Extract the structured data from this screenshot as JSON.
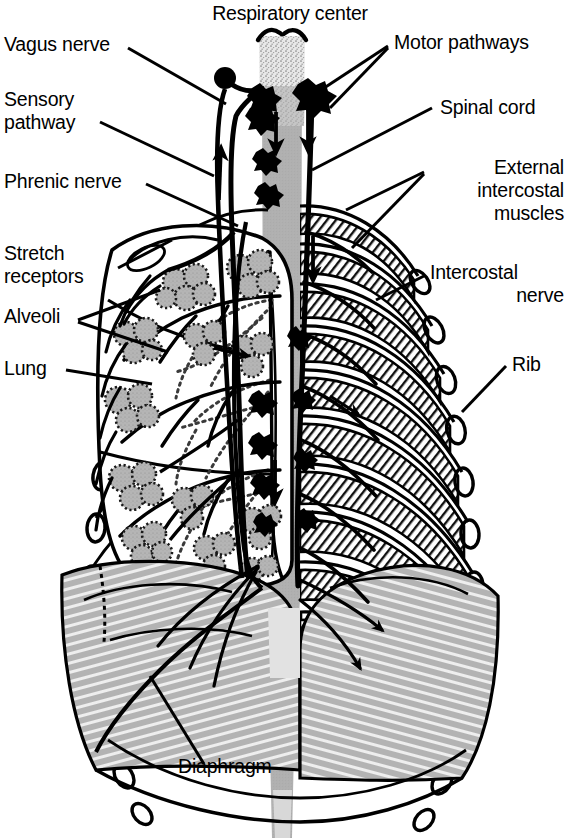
{
  "figure": {
    "title": "Respiratory center",
    "colors": {
      "ink": "#000000",
      "background": "#ffffff",
      "spinal_cord_gray": "#b0b0b0",
      "spinal_cord_stipple_gray": "#cfcfcf",
      "alveoli_gray": "#b5b5b5",
      "diaphragm_gray": "#b3b3b3",
      "muscle_gray": "#a8a8a8"
    }
  },
  "labels": {
    "respiratory_center": "Respiratory center",
    "vagus_nerve": "Vagus nerve",
    "sensory_pathway_line1": "Sensory",
    "sensory_pathway_line2": "pathway",
    "phrenic_nerve": "Phrenic nerve",
    "stretch_receptors_line1": "Stretch",
    "stretch_receptors_line2": "receptors",
    "alveoli": "Alveoli",
    "lung": "Lung",
    "motor_pathways": "Motor pathways",
    "spinal_cord": "Spinal cord",
    "external_intercostal_line1": "External",
    "external_intercostal_line2": "intercostal",
    "external_intercostal_line3": "muscles",
    "intercostal_nerve_line1": "Intercostal",
    "intercostal_nerve_line2": "nerve",
    "rib": "Rib",
    "diaphragm": "Diaphragm"
  },
  "structures": [
    {
      "name": "respiratory-center",
      "side": "center",
      "note": "stippled medulla at top of spinal cord"
    },
    {
      "name": "spinal-cord",
      "side": "center",
      "note": "vertical gray band tapering downward"
    },
    {
      "name": "vagus-nerve",
      "side": "left",
      "note": "afferent nerve with ganglion, ascends to medulla"
    },
    {
      "name": "sensory-pathway",
      "side": "center-left",
      "note": "ascending arrow into respiratory center"
    },
    {
      "name": "motor-pathways",
      "side": "center-right",
      "note": "two descending arrows from ganglia"
    },
    {
      "name": "phrenic-nerve",
      "side": "left",
      "note": "descends to diaphragm"
    },
    {
      "name": "stretch-receptors",
      "side": "left",
      "note": "in lung wall"
    },
    {
      "name": "alveoli",
      "side": "left",
      "note": "gray grape-like clusters on dotted bronchi"
    },
    {
      "name": "lung",
      "side": "left",
      "note": "left lung outline with lobes"
    },
    {
      "name": "external-intercostal-muscles",
      "side": "right",
      "note": "hatched bands between ribs"
    },
    {
      "name": "intercostal-nerve",
      "side": "right",
      "note": "runs along rib"
    },
    {
      "name": "rib",
      "side": "right",
      "note": "curved rib bones, twelve pairs"
    },
    {
      "name": "diaphragm",
      "side": "bottom",
      "note": "gray striated dome"
    }
  ]
}
